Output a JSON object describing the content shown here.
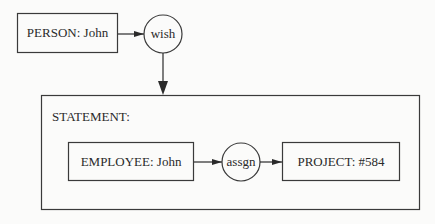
{
  "nodes": {
    "person": {
      "label": "PERSON: John"
    },
    "wish": {
      "label": "wish"
    },
    "statement": {
      "label": "STATEMENT:"
    },
    "employee": {
      "label": "EMPLOYEE: John"
    },
    "assgn": {
      "label": "assgn"
    },
    "project": {
      "label": "PROJECT: #584"
    }
  },
  "colors": {
    "stroke": "#3a3a3a",
    "background": "#fbfbfa"
  }
}
